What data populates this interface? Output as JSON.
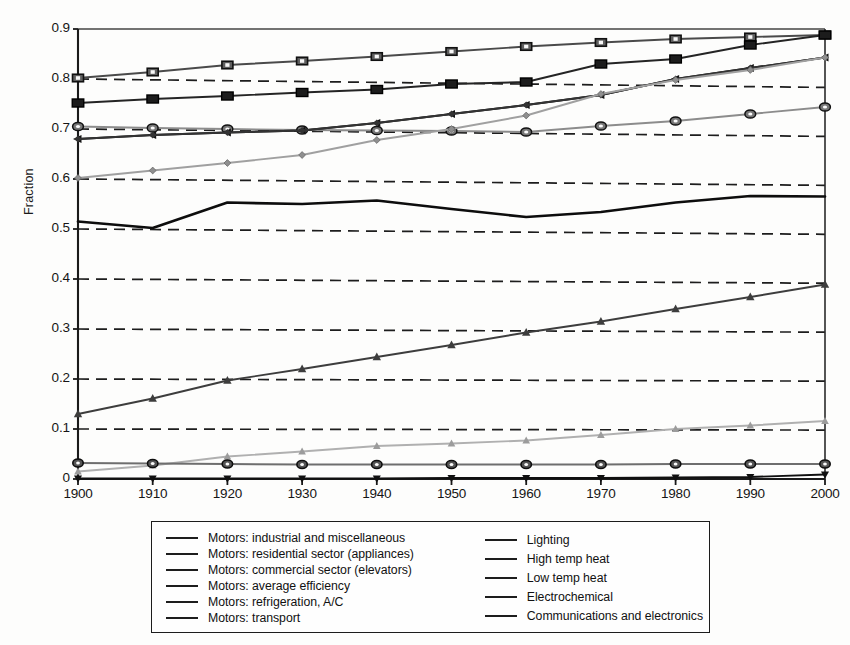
{
  "figure": {
    "ylabel": "Fraction",
    "title": "",
    "xlabel": ""
  },
  "axis": {
    "y_ticks": [
      "0.9",
      "0.8",
      "0.7",
      "0.6",
      "0.5",
      "0.4",
      "0.3",
      "0.2",
      "0.1",
      "0"
    ],
    "x_ticks": [
      "1900",
      "1910",
      "1920",
      "1930",
      "1940",
      "1950",
      "1960",
      "1970",
      "1980",
      "1990",
      "2000"
    ]
  },
  "legend": {
    "left_items": [
      {
        "label": "Motors: industrial and miscellaneous",
        "marker": "square-open-icon"
      },
      {
        "label": "Motors: residential sector (appliances)",
        "marker": "circle-open-icon"
      },
      {
        "label": "Motors: commercial sector (elevators)",
        "marker": "triangle-left-filled-icon"
      },
      {
        "label": "Motors: average efficiency",
        "marker": "line-plain-icon"
      },
      {
        "label": "Motors: refrigeration, A/C",
        "marker": "diamond-small-icon"
      },
      {
        "label": "Motors: transport",
        "marker": "diamond-light-icon"
      }
    ],
    "right_items": [
      {
        "label": "Lighting",
        "marker": "triangle-up-light-icon"
      },
      {
        "label": "High temp heat",
        "marker": "square-open-dark-icon"
      },
      {
        "label": "Low temp heat",
        "marker": "circle-open-dark-icon"
      },
      {
        "label": "Electrochemical",
        "marker": "triangle-up-filled-icon"
      },
      {
        "label": "Communications and electronics",
        "marker": "triangle-down-filled-icon"
      }
    ]
  },
  "chart_data": {
    "type": "line",
    "title": "",
    "xlabel": "",
    "ylabel": "Fraction",
    "x": [
      1900,
      1910,
      1920,
      1930,
      1940,
      1950,
      1960,
      1970,
      1980,
      1990,
      2000
    ],
    "xlim": [
      1900,
      2000
    ],
    "ylim": [
      0,
      0.9
    ],
    "grid": "horizontal-dashed",
    "legend_position": "below-plot",
    "series": [
      {
        "name": "Motors: industrial and miscellaneous",
        "marker": "square-open",
        "color": "#4a4a4a",
        "values": [
          0.802,
          0.814,
          0.828,
          0.836,
          0.845,
          0.855,
          0.865,
          0.873,
          0.88,
          0.884,
          0.888
        ]
      },
      {
        "name": "Motors: residential sector (appliances)",
        "marker": "circle-open",
        "color": "#8c8c8c",
        "values": [
          0.705,
          0.702,
          0.7,
          0.698,
          0.697,
          0.696,
          0.694,
          0.706,
          0.716,
          0.73,
          0.744
        ]
      },
      {
        "name": "Motors: commercial sector (elevators)",
        "marker": "triangle-left-filled",
        "color": "#141414",
        "values": [
          0.68,
          0.688,
          0.693,
          0.697,
          0.712,
          0.73,
          0.748,
          0.768,
          0.8,
          0.822,
          0.843
        ]
      },
      {
        "name": "Motors: average efficiency",
        "marker": "line-plain",
        "color": "#0d0d0d",
        "values": [
          0.515,
          0.502,
          0.553,
          0.55,
          0.557,
          0.54,
          0.524,
          0.534,
          0.553,
          0.566,
          0.565
        ]
      },
      {
        "name": "Motors: refrigeration, A/C",
        "marker": "diamond-small",
        "color": "#333333",
        "values": [
          0.68,
          0.688,
          0.693,
          0.697,
          0.712,
          0.73,
          0.748,
          0.768,
          0.8,
          0.822,
          0.843
        ]
      },
      {
        "name": "Motors: transport",
        "marker": "diamond-light",
        "color": "#a0a0a0",
        "values": [
          0.602,
          0.617,
          0.632,
          0.648,
          0.678,
          0.7,
          0.727,
          0.77,
          0.798,
          0.818,
          0.843
        ]
      },
      {
        "name": "Lighting",
        "marker": "triangle-up-light",
        "color": "#b0b0b0",
        "values": [
          0.015,
          0.027,
          0.045,
          0.055,
          0.066,
          0.071,
          0.077,
          0.088,
          0.1,
          0.107,
          0.116
        ]
      },
      {
        "name": "High temp heat",
        "marker": "square-open-dark",
        "color": "#242424",
        "values": [
          0.752,
          0.76,
          0.766,
          0.773,
          0.779,
          0.79,
          0.794,
          0.83,
          0.84,
          0.868,
          0.888
        ]
      },
      {
        "name": "Low temp heat",
        "marker": "circle-open-dark",
        "color": "#6e6e6e",
        "values": [
          0.032,
          0.031,
          0.03,
          0.029,
          0.029,
          0.029,
          0.029,
          0.029,
          0.03,
          0.03,
          0.03
        ]
      },
      {
        "name": "Electrochemical",
        "marker": "triangle-up-filled",
        "color": "#3d3d3d",
        "values": [
          0.13,
          0.161,
          0.197,
          0.22,
          0.244,
          0.268,
          0.293,
          0.315,
          0.34,
          0.364,
          0.389
        ]
      },
      {
        "name": "Communications and electronics",
        "marker": "triangle-down-filled",
        "color": "#101010",
        "values": [
          0.001,
          0.001,
          0.001,
          0.001,
          0.001,
          0.002,
          0.002,
          0.002,
          0.003,
          0.004,
          0.009
        ]
      }
    ]
  }
}
